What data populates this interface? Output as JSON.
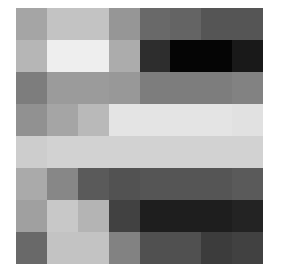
{
  "chart_data": {
    "type": "heatmap",
    "title": "",
    "xlabel": "",
    "ylabel": "",
    "rows": 8,
    "cols": 8,
    "colormap": "grayscale",
    "value_range": [
      0,
      255
    ],
    "grid": false,
    "legend": "none",
    "values": [
      [
        165,
        195,
        195,
        150,
        105,
        100,
        85,
        85
      ],
      [
        182,
        238,
        238,
        172,
        45,
        5,
        5,
        25
      ],
      [
        125,
        155,
        155,
        152,
        125,
        125,
        125,
        130
      ],
      [
        145,
        165,
        185,
        228,
        228,
        228,
        228,
        225
      ],
      [
        205,
        210,
        210,
        210,
        210,
        210,
        210,
        210
      ],
      [
        170,
        135,
        90,
        82,
        85,
        85,
        85,
        90
      ],
      [
        160,
        200,
        180,
        65,
        30,
        30,
        30,
        35
      ],
      [
        105,
        195,
        195,
        130,
        80,
        80,
        60,
        65
      ]
    ]
  }
}
